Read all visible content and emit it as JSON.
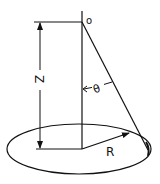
{
  "diagram": {
    "labels": {
      "origin": "o",
      "height": "Z",
      "angle": "θ",
      "radius": "R"
    },
    "colors": {
      "stroke": "#111111",
      "background": "#ffffff"
    }
  }
}
